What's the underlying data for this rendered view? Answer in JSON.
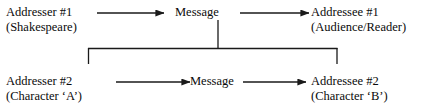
{
  "diagram": {
    "nodes": {
      "addresser1": {
        "line1": "Addresser #1",
        "line2": "(Shakespeare)"
      },
      "message_top": {
        "line1": "Message"
      },
      "addressee1": {
        "line1": "Addressee #1",
        "line2": "(Audience/Reader)"
      },
      "addresser2": {
        "line1": "Addresser #2",
        "line2": "(Character ‘A’)"
      },
      "message_bottom": {
        "line1": "Message"
      },
      "addressee2": {
        "line1": "Addressee #2",
        "line2": "(Character ‘B’)"
      }
    },
    "colors": {
      "stroke": "#1a1a1a",
      "text": "#0a0a0a",
      "background": "#ffffff"
    }
  }
}
